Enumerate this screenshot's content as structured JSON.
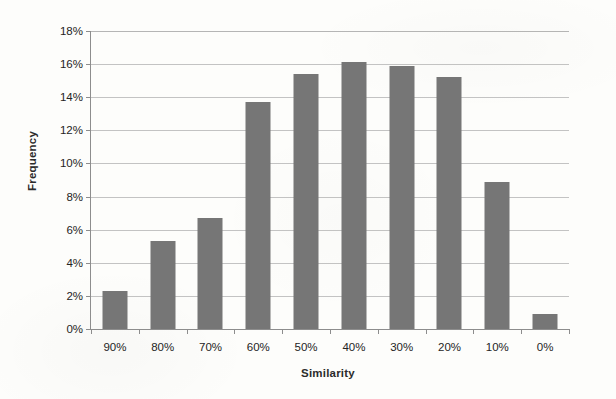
{
  "chart_data": {
    "type": "bar",
    "title": "",
    "subtitle": "",
    "xlabel": "Similarity",
    "ylabel": "Frequency",
    "categories": [
      "90%",
      "80%",
      "70%",
      "60%",
      "50%",
      "40%",
      "30%",
      "20%",
      "10%",
      "0%"
    ],
    "values": [
      2.3,
      5.3,
      6.7,
      13.7,
      15.4,
      16.1,
      15.9,
      15.2,
      8.9,
      0.9
    ],
    "value_unit": "%",
    "ylim": [
      0,
      18
    ],
    "ytick_values": [
      0,
      2,
      4,
      6,
      8,
      10,
      12,
      14,
      16,
      18
    ],
    "ytick_labels": [
      "0%",
      "2%",
      "4%",
      "6%",
      "8%",
      "10%",
      "12%",
      "14%",
      "16%",
      "18%"
    ],
    "grid": true,
    "grid_axis": "y",
    "legend": false,
    "legend_position": "none",
    "annotations": [],
    "series": [
      {
        "name": "Frequency",
        "color": "#767676",
        "values": [
          2.3,
          5.3,
          6.7,
          13.7,
          15.4,
          16.1,
          15.9,
          15.2,
          8.9,
          0.9
        ]
      }
    ]
  },
  "colors": {
    "bar": "#767676",
    "gridline": "#b9b9b9",
    "axis": "#8d8d8d",
    "text": "#242424",
    "background": "#fdfdfb"
  }
}
